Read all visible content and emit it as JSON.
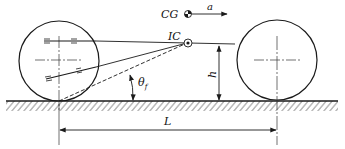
{
  "diagram": {
    "labels": {
      "cg": "CG",
      "acceleration": "a",
      "instant_center": "IC",
      "height": "h",
      "angle": "θ",
      "angle_subscript": "f",
      "wheelbase": "L"
    },
    "colors": {
      "line": "#1a1a1a",
      "hatch": "#555555"
    }
  }
}
